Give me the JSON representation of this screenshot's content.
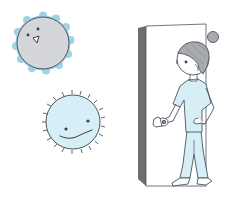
{
  "illustration": {
    "subject": "nurse-opening-door-with-germs",
    "colors": {
      "background": "#ffffff",
      "outline": "#4a5560",
      "virus_gray": "#d4d6d9",
      "virus_gray_halo": "#9ed3e6",
      "virus_blue": "#d6eef6",
      "scrubs": "#d6eef6",
      "hair": "#a9abae",
      "door_shadow": "#6d6e70",
      "door_face": "#ffffff",
      "skin": "#ffffff"
    },
    "elements": [
      {
        "name": "gray-virus",
        "description": "gray round germ with blue wavy halo and small face"
      },
      {
        "name": "blue-virus",
        "description": "light blue spiky germ with wavy smile"
      },
      {
        "name": "door",
        "description": "white door partially open with dark gray edge"
      },
      {
        "name": "nurse",
        "description": "nurse in light blue scrubs with hair bun holding doorknob"
      }
    ]
  }
}
